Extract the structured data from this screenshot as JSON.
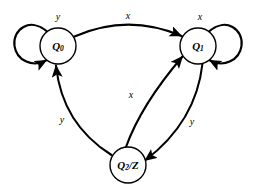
{
  "figure": {
    "kind": "state-transition-diagram",
    "background_color": "#ffffff",
    "stroke_color": "#000000"
  },
  "states": [
    {
      "id": "q0",
      "label_base": "Q",
      "label_sub": "0",
      "label_text": "Q0",
      "cx": 58,
      "cy": 46,
      "r": 18
    },
    {
      "id": "q1",
      "label_base": "Q",
      "label_sub": "1",
      "label_text": "Q1",
      "cx": 198,
      "cy": 46,
      "r": 18
    },
    {
      "id": "q2",
      "label_base": "Q",
      "label_sub": "2",
      "label_suffix": "/Z",
      "label_text": "Q2/Z",
      "cx": 128,
      "cy": 165,
      "r": 18
    }
  ],
  "self_loops": [
    {
      "id": "loop-q0",
      "state": "q0",
      "side": "left",
      "label": "y",
      "label_x": 58,
      "label_y": 16
    },
    {
      "id": "loop-q1",
      "state": "q1",
      "side": "right",
      "label": "x",
      "label_x": 200,
      "label_y": 16
    }
  ],
  "transitions": [
    {
      "id": "q0-to-q1",
      "from": "q0",
      "to": "q1",
      "label": "x",
      "label_x": 128,
      "label_y": 15
    },
    {
      "id": "q2-to-q0",
      "from": "q2",
      "to": "q0",
      "label": "y",
      "label_x": 62,
      "label_y": 119
    },
    {
      "id": "q2-to-q1",
      "from": "q2",
      "to": "q1",
      "label": "x",
      "label_x": 131,
      "label_y": 94
    },
    {
      "id": "q1-to-q2",
      "from": "q1",
      "to": "q2",
      "label": "y",
      "label_x": 192,
      "label_y": 121
    }
  ]
}
